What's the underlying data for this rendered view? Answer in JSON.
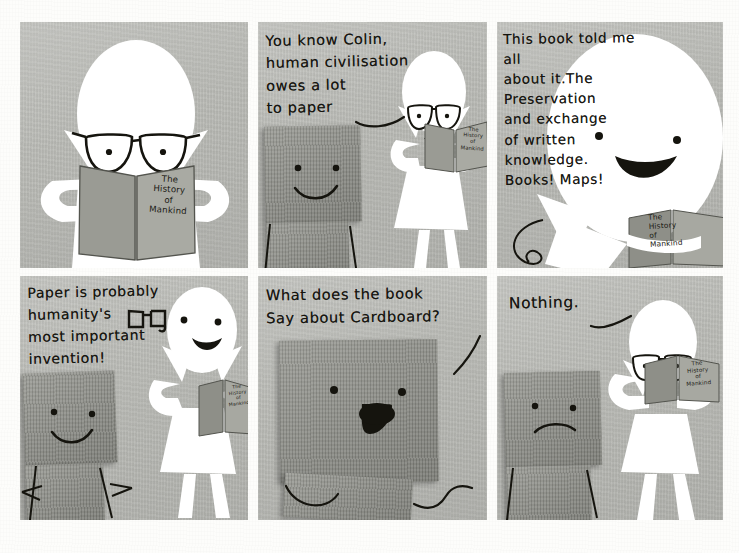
{
  "meta": {
    "kind": "paper-craft-comic-strip",
    "rows": 2,
    "columns": 3,
    "panel_count": 6,
    "background_color": "#fdfdfb",
    "panel_color": "#b9bab5",
    "cardboard_color": "#8f9089",
    "paper_figure_color": "#ffffff",
    "ink_color": "#16150f"
  },
  "book": {
    "title_lines": "The\nHistory\nof\nMankind",
    "title_full": "The History of Mankind"
  },
  "panels": [
    {
      "id": 1,
      "row": 1,
      "column": 1,
      "dialogue": "",
      "characters": [
        "paper-person"
      ],
      "props": [
        "book"
      ],
      "description": "Paper person with glasses reading The History of Mankind",
      "expression": "neutral-line-mouth"
    },
    {
      "id": 2,
      "row": 1,
      "column": 2,
      "dialogue": "You know Colin,\nhuman civilisation\nowes  a  lot\n to  paper",
      "speaker": "paper-person",
      "characters": [
        "cardboard-person",
        "paper-person"
      ],
      "props": [
        "book"
      ],
      "description": "Paper person talks to cardboard box character named Colin",
      "expression": "smile"
    },
    {
      "id": 3,
      "row": 1,
      "column": 3,
      "dialogue": "This book told me all\nabout it.The\nPreservation\nand exchange\nof written\nknowledge.\nBooks! Maps!",
      "speaker": "paper-person",
      "characters": [
        "paper-person"
      ],
      "props": [
        "book"
      ],
      "description": "Close up of paper person mid-speech, open mouth",
      "expression": "open-mouth-excited"
    },
    {
      "id": 4,
      "row": 2,
      "column": 1,
      "dialogue": "Paper is probably\nhumanity's\nmost important\n  invention!",
      "speaker": "paper-person",
      "characters": [
        "cardboard-person",
        "paper-person"
      ],
      "props": [
        "book",
        "drawn-glasses-doodle"
      ],
      "description": "Paper person holds book at side, cardboard listens",
      "expression": "smile-open"
    },
    {
      "id": 5,
      "row": 2,
      "column": 2,
      "dialogue": "What does the book\n  Say about Cardboard?",
      "speaker": "cardboard-person",
      "characters": [
        "cardboard-person"
      ],
      "props": [],
      "description": "Large close up of cardboard character asking a question, wavy drawn arms",
      "expression": "open-mouth-hopeful"
    },
    {
      "id": 6,
      "row": 2,
      "column": 3,
      "dialogue": "Nothing.",
      "speaker": "paper-person",
      "characters": [
        "cardboard-person",
        "paper-person"
      ],
      "props": [
        "book"
      ],
      "description": "Paper person reads book, cardboard character frowns",
      "expression": "frown"
    }
  ]
}
